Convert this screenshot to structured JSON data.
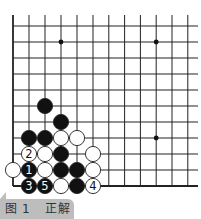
{
  "caption": {
    "figure": "图",
    "number": "1",
    "title": "正解"
  },
  "board": {
    "x0": 13,
    "y0": 26,
    "spacing": 16,
    "cols": 12,
    "rows": 11,
    "right_extent": 198,
    "star_points": [
      [
        3,
        1
      ],
      [
        9,
        1
      ],
      [
        9,
        7
      ]
    ],
    "stones": [
      {
        "col": 2,
        "row": 5,
        "color": "black",
        "label": ""
      },
      {
        "col": 3,
        "row": 6,
        "color": "black",
        "label": ""
      },
      {
        "col": 1,
        "row": 7,
        "color": "black",
        "label": ""
      },
      {
        "col": 2,
        "row": 7,
        "color": "black",
        "label": ""
      },
      {
        "col": 3,
        "row": 7,
        "color": "white",
        "label": ""
      },
      {
        "col": 4,
        "row": 7,
        "color": "white",
        "label": ""
      },
      {
        "col": 1,
        "row": 8,
        "color": "white",
        "label": "2"
      },
      {
        "col": 2,
        "row": 8,
        "color": "white",
        "label": ""
      },
      {
        "col": 3,
        "row": 8,
        "color": "black",
        "label": ""
      },
      {
        "col": 5,
        "row": 8,
        "color": "white",
        "label": ""
      },
      {
        "col": 0,
        "row": 9,
        "color": "white",
        "label": ""
      },
      {
        "col": 1,
        "row": 9,
        "color": "black",
        "label": "1"
      },
      {
        "col": 2,
        "row": 9,
        "color": "white",
        "label": ""
      },
      {
        "col": 3,
        "row": 9,
        "color": "black",
        "label": ""
      },
      {
        "col": 4,
        "row": 9,
        "color": "black",
        "label": ""
      },
      {
        "col": 5,
        "row": 9,
        "color": "white",
        "label": ""
      },
      {
        "col": 1,
        "row": 10,
        "color": "black",
        "label": "3"
      },
      {
        "col": 2,
        "row": 10,
        "color": "black",
        "label": "5"
      },
      {
        "col": 3,
        "row": 10,
        "color": "white",
        "label": ""
      },
      {
        "col": 4,
        "row": 10,
        "color": "black",
        "label": ""
      },
      {
        "col": 5,
        "row": 10,
        "color": "white",
        "label": "4"
      }
    ]
  }
}
